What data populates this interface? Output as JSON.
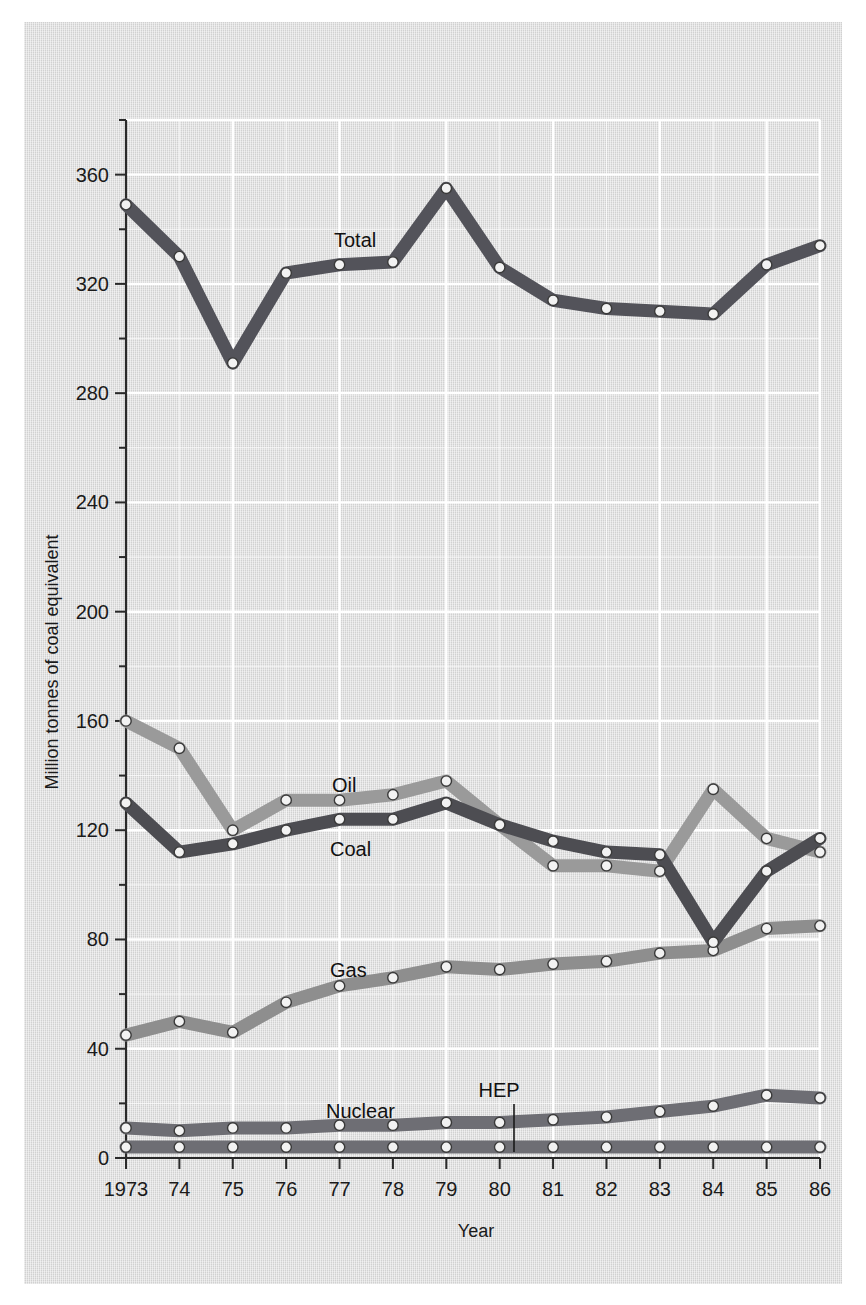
{
  "figure": {
    "background_color": "#d8d8d8",
    "grid_color": "#ffffff",
    "axis_color": "#2a2a2a"
  },
  "axes": {
    "y_title": "Million tonnes of coal equivalent",
    "x_title": "Year",
    "y_ticks": [
      "0",
      "20",
      "40",
      "60",
      "80",
      "100",
      "120",
      "140",
      "160",
      "180",
      "200",
      "220",
      "240",
      "260",
      "280",
      "300",
      "320",
      "340",
      "360",
      "380"
    ],
    "x_ticks": [
      "1973",
      "74",
      "75",
      "76",
      "77",
      "78",
      "79",
      "80",
      "81",
      "82",
      "83",
      "84",
      "85",
      "86"
    ]
  },
  "labels": {
    "total": "Total",
    "oil": "Oil",
    "coal": "Coal",
    "gas": "Gas",
    "nuclear": "Nuclear",
    "hep": "HEP"
  },
  "chart_data": {
    "type": "line",
    "title": "",
    "xlabel": "Year",
    "ylabel": "Million tonnes of coal equivalent",
    "xlim": [
      1973,
      1986
    ],
    "ylim": [
      0,
      380
    ],
    "ytick_step": 20,
    "grid": true,
    "legend": "inline-labels",
    "x": [
      1973,
      1974,
      1975,
      1976,
      1977,
      1978,
      1979,
      1980,
      1981,
      1982,
      1983,
      1984,
      1985,
      1986
    ],
    "categories": [
      "1973",
      "74",
      "75",
      "76",
      "77",
      "78",
      "79",
      "80",
      "81",
      "82",
      "83",
      "84",
      "85",
      "86"
    ],
    "series": [
      {
        "name": "Total",
        "color": "#53535a",
        "values": [
          349,
          330,
          291,
          324,
          327,
          328,
          355,
          326,
          314,
          311,
          310,
          309,
          327,
          334
        ]
      },
      {
        "name": "Oil",
        "color": "#9a9a9a",
        "values": [
          160,
          150,
          120,
          131,
          131,
          133,
          138,
          122,
          107,
          107,
          105,
          135,
          117,
          112
        ]
      },
      {
        "name": "Coal",
        "color": "#4d4d52",
        "values": [
          130,
          112,
          115,
          120,
          124,
          124,
          130,
          122,
          116,
          112,
          111,
          79,
          105,
          117
        ]
      },
      {
        "name": "Gas",
        "color": "#8e8e8e",
        "values": [
          45,
          50,
          46,
          57,
          63,
          66,
          70,
          69,
          71,
          72,
          75,
          76,
          84,
          85
        ]
      },
      {
        "name": "Nuclear",
        "color": "#6e6e74",
        "values": [
          11,
          10,
          11,
          11,
          12,
          12,
          13,
          13,
          14,
          15,
          17,
          19,
          23,
          22
        ]
      },
      {
        "name": "HEP",
        "color": "#6e6e74",
        "values": [
          4,
          4,
          4,
          4,
          4,
          4,
          4,
          4,
          4,
          4,
          4,
          4,
          4,
          4
        ]
      }
    ]
  }
}
